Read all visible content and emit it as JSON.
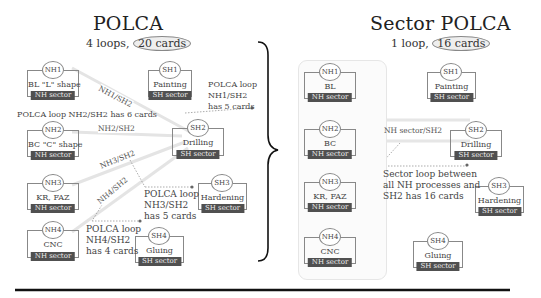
{
  "left": {
    "title": "POLCA",
    "subtitle_prefix": "4 loops,",
    "subtitle_highlight": "20 cards",
    "nodes": [
      {
        "id": "NH1",
        "process": "BL \"L\" shape",
        "sector": "NH sector"
      },
      {
        "id": "NH2",
        "process": "BC \"C\" shape",
        "sector": "NH sector"
      },
      {
        "id": "NH3",
        "process": "KR, FAZ",
        "sector": "NH sector"
      },
      {
        "id": "NH4",
        "process": "CNC",
        "sector": "NH sector"
      },
      {
        "id": "SH1",
        "process": "Painting",
        "sector": "SH sector"
      },
      {
        "id": "SH2",
        "process": "Drilling",
        "sector": "SH sector"
      },
      {
        "id": "SH3",
        "process": "Hardening",
        "sector": "SH sector"
      },
      {
        "id": "SH4",
        "process": "Gluing",
        "sector": "SH sector"
      }
    ],
    "loop_labels": [
      "NH1/SH2",
      "NH2/SH2",
      "NH3/SH2",
      "NH4/SH2"
    ],
    "notes": {
      "nh1": [
        "POLCA loop",
        "NH1/SH2",
        "has 5 cards"
      ],
      "nh2": "POLCA loop NH2/SH2 has 6 cards",
      "nh3": [
        "POLCA loop",
        "NH3/SH2",
        "has 5 cards"
      ],
      "nh4": [
        "POLCA loop",
        "NH4/SH2",
        "has 4 cards"
      ]
    }
  },
  "right": {
    "title": "Sector POLCA",
    "subtitle_prefix": "1 loop,",
    "subtitle_highlight": "16 cards",
    "nodes": [
      {
        "id": "NH1",
        "process": "BL",
        "sector": "NH sector"
      },
      {
        "id": "NH2",
        "process": "BC",
        "sector": "NH sector"
      },
      {
        "id": "NH3",
        "process": "KR, FAZ",
        "sector": "NH sector"
      },
      {
        "id": "NH4",
        "process": "CNC",
        "sector": "NH sector"
      },
      {
        "id": "SH1",
        "process": "Painting",
        "sector": "SH sector"
      },
      {
        "id": "SH2",
        "process": "Drilling",
        "sector": "SH sector"
      },
      {
        "id": "SH3",
        "process": "Hardening",
        "sector": "SH sector"
      },
      {
        "id": "SH4",
        "process": "Gluing",
        "sector": "SH sector"
      }
    ],
    "loop_label": "NH sector/SH2",
    "note": [
      "Sector loop between",
      "all NH processes and",
      "SH2 has 16 cards"
    ]
  },
  "colors": {
    "sector_badge": "#505050",
    "highlight_pill": "#eeeeee",
    "loop_line": "#e2e2e2",
    "note_dot": "#666666"
  }
}
